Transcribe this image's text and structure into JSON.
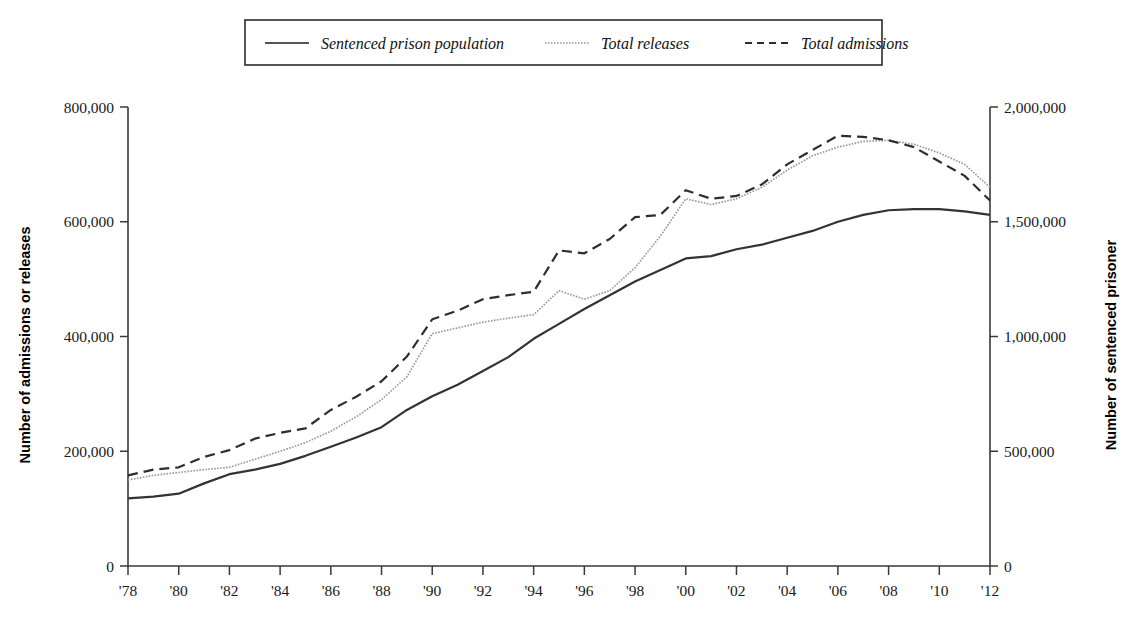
{
  "chart_data": {
    "type": "line",
    "title": "",
    "xlabel": "",
    "ylabel": "Number of admissions or releases",
    "y2label": "Number of sentenced prisoner",
    "grid": false,
    "legend_position": "top-center",
    "xlim": [
      1978,
      2012
    ],
    "ylim": [
      0,
      800000
    ],
    "y2lim": [
      0,
      2000000
    ],
    "ytick_labels": [
      "0",
      "200,000",
      "400,000",
      "600,000",
      "800,000"
    ],
    "ytick_values": [
      0,
      200000,
      400000,
      600000,
      800000
    ],
    "y2tick_labels": [
      "0",
      "500,000",
      "1,000,000",
      "1,500,000",
      "2,000,000"
    ],
    "y2tick_values": [
      0,
      500000,
      1000000,
      1500000,
      2000000
    ],
    "x": [
      1978,
      1979,
      1980,
      1981,
      1982,
      1983,
      1984,
      1985,
      1986,
      1987,
      1988,
      1989,
      1990,
      1991,
      1992,
      1993,
      1994,
      1995,
      1996,
      1997,
      1998,
      1999,
      2000,
      2001,
      2002,
      2003,
      2004,
      2005,
      2006,
      2007,
      2008,
      2009,
      2010,
      2011,
      2012
    ],
    "xtick_values": [
      1978,
      1980,
      1982,
      1984,
      1986,
      1988,
      1990,
      1992,
      1994,
      1996,
      1998,
      2000,
      2002,
      2004,
      2006,
      2008,
      2010,
      2012
    ],
    "xtick_labels": [
      "'78",
      "'80",
      "'82",
      "'84",
      "'86",
      "'88",
      "'90",
      "'92",
      "'94",
      "'96",
      "'98",
      "'00",
      "'02",
      "'04",
      "'06",
      "'08",
      "'10",
      "'12"
    ],
    "series": [
      {
        "name": "Sentenced prison population",
        "style": "solid",
        "axis": "right",
        "color": "#333333",
        "values_right_axis": [
          295000,
          302000,
          315000,
          360000,
          400000,
          420000,
          445000,
          480000,
          520000,
          560000,
          605000,
          680000,
          740000,
          790000,
          850000,
          910000,
          990000,
          1055000,
          1120000,
          1180000,
          1240000,
          1290000,
          1340000,
          1350000,
          1380000,
          1400000,
          1430000,
          1460000,
          1500000,
          1530000,
          1550000,
          1555000,
          1555000,
          1545000,
          1530000
        ]
      },
      {
        "name": "Total releases",
        "style": "dotted",
        "axis": "left",
        "color": "#9a9a9a",
        "values": [
          150000,
          158000,
          163000,
          168000,
          172000,
          186000,
          200000,
          215000,
          235000,
          260000,
          290000,
          330000,
          405000,
          415000,
          425000,
          432000,
          438000,
          480000,
          465000,
          480000,
          520000,
          575000,
          640000,
          630000,
          640000,
          660000,
          690000,
          715000,
          730000,
          740000,
          742000,
          735000,
          720000,
          700000,
          660000
        ]
      },
      {
        "name": "Total admissions",
        "style": "dashed",
        "axis": "left",
        "color": "#2e2e2e",
        "values": [
          158000,
          168000,
          172000,
          190000,
          202000,
          222000,
          232000,
          240000,
          272000,
          295000,
          322000,
          365000,
          430000,
          445000,
          465000,
          472000,
          478000,
          550000,
          545000,
          570000,
          608000,
          612000,
          655000,
          640000,
          645000,
          665000,
          700000,
          725000,
          750000,
          748000,
          742000,
          730000,
          705000,
          680000,
          637000
        ]
      }
    ]
  },
  "legend": {
    "items": [
      {
        "label": "Sentenced prison population",
        "style": "solid"
      },
      {
        "label": "Total releases",
        "style": "dotted"
      },
      {
        "label": "Total admissions",
        "style": "dashed"
      }
    ]
  }
}
